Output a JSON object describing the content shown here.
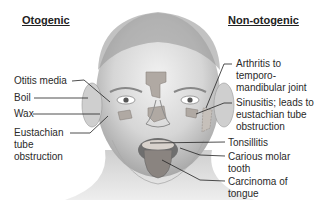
{
  "headings": {
    "left": "Otogenic",
    "right": "Non-otogenic"
  },
  "left_labels": [
    {
      "text": "Otitis media"
    },
    {
      "text": "Boil"
    },
    {
      "text": "Wax"
    },
    {
      "lines": [
        "Eustachian",
        "tube",
        "obstruction"
      ]
    }
  ],
  "right_labels": [
    {
      "lines": [
        "Arthritis to temporo-",
        "mandibular joint"
      ]
    },
    {
      "lines": [
        "Sinusitis; leads to",
        "eustachian tube",
        "obstruction"
      ]
    },
    {
      "text": "Tonsillitis"
    },
    {
      "lines": [
        "Carious molar",
        "tooth"
      ]
    },
    {
      "lines": [
        "Carcinoma of",
        "tongue"
      ]
    }
  ],
  "colors": {
    "skin_light": "#e8e8e8",
    "skin_shade": "#b8b8b8",
    "highlight_region": "#b0a9a3",
    "tongue": "#8a8480",
    "line": "#222222"
  }
}
